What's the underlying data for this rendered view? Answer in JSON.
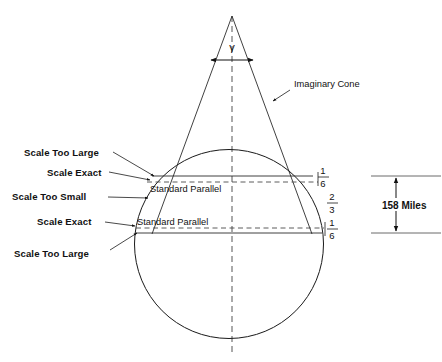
{
  "figure": {
    "apex_angle_symbol": "γ",
    "cone_label": "Imaginary Cone",
    "standard_parallel_upper": "Standard Parallel",
    "standard_parallel_lower": "Standard Parallel",
    "scale_annotations": [
      {
        "id": "scale-too-large-top",
        "text": "Scale Too Large"
      },
      {
        "id": "scale-exact-top",
        "text": "Scale Exact"
      },
      {
        "id": "scale-too-small",
        "text": "Scale Too Small"
      },
      {
        "id": "scale-exact-bottom",
        "text": "Scale Exact"
      },
      {
        "id": "scale-too-large-bottom",
        "text": "Scale Too Large"
      }
    ],
    "band_fractions": [
      {
        "id": "band-upper",
        "numerator": "1",
        "denominator": "6"
      },
      {
        "id": "band-middle",
        "numerator": "2",
        "denominator": "3"
      },
      {
        "id": "band-lower",
        "numerator": "1",
        "denominator": "6"
      }
    ],
    "scale_bar": {
      "label": "158 Miles"
    }
  },
  "colors": {
    "ink": "#1a1a1a",
    "dash": "#555555",
    "scale_rule": "#6a6a6a",
    "background": "#ffffff"
  }
}
